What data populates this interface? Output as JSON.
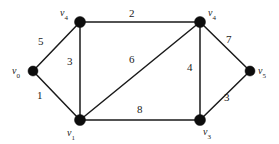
{
  "figure": {
    "background_color": "#ffffff",
    "line_color": "#1a1a1a",
    "node_color": "#0d0d0d"
  },
  "chart_data": {
    "type": "diagram",
    "diagram_kind": "weighted undirected graph",
    "title": "",
    "nodes": [
      {
        "id": "n0",
        "label": "v",
        "subscript": "0",
        "x": 33,
        "y": 71,
        "r": 5,
        "label_x": 12,
        "label_y": 66,
        "label_anchor": "left"
      },
      {
        "id": "n1",
        "label": "v",
        "subscript": "4",
        "x": 80,
        "y": 22,
        "r": 5.5,
        "label_x": 60,
        "label_y": 8,
        "label_anchor": "left"
      },
      {
        "id": "n2",
        "label": "v",
        "subscript": "4",
        "x": 200,
        "y": 22,
        "r": 5.5,
        "label_x": 208,
        "label_y": 8,
        "label_anchor": "left"
      },
      {
        "id": "n3",
        "label": "v",
        "subscript": "1",
        "x": 80,
        "y": 120,
        "r": 5.5,
        "label_x": 67,
        "label_y": 128,
        "label_anchor": "left"
      },
      {
        "id": "n4",
        "label": "v",
        "subscript": "3",
        "x": 200,
        "y": 120,
        "r": 5.5,
        "label_x": 203,
        "label_y": 127,
        "label_anchor": "left"
      },
      {
        "id": "n5",
        "label": "v",
        "subscript": "5",
        "x": 250,
        "y": 71,
        "r": 5,
        "label_x": 258,
        "label_y": 66,
        "label_anchor": "left"
      }
    ],
    "edges": [
      {
        "id": "e1",
        "from": "n0",
        "to": "n1",
        "weight": "5",
        "label_x": 38,
        "label_y": 36
      },
      {
        "id": "e2",
        "from": "n0",
        "to": "n3",
        "weight": "1",
        "label_x": 37,
        "label_y": 90
      },
      {
        "id": "e3",
        "from": "n1",
        "to": "n2",
        "weight": "2",
        "label_x": 129,
        "label_y": 8
      },
      {
        "id": "e4",
        "from": "n1",
        "to": "n3",
        "weight": "3",
        "label_x": 67,
        "label_y": 56
      },
      {
        "id": "e5",
        "from": "n3",
        "to": "n2",
        "weight": "6",
        "label_x": 129,
        "label_y": 54
      },
      {
        "id": "e6",
        "from": "n3",
        "to": "n4",
        "weight": "8",
        "label_x": 137,
        "label_y": 104
      },
      {
        "id": "e7",
        "from": "n2",
        "to": "n4",
        "weight": "4",
        "label_x": 187,
        "label_y": 62
      },
      {
        "id": "e8",
        "from": "n2",
        "to": "n5",
        "weight": "7",
        "label_x": 226,
        "label_y": 34
      },
      {
        "id": "e9",
        "from": "n4",
        "to": "n5",
        "weight": "3",
        "label_x": 224,
        "label_y": 92
      }
    ]
  }
}
